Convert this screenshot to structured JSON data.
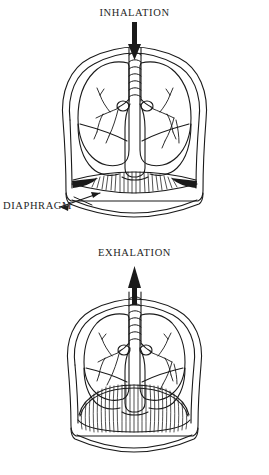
{
  "document": {
    "type": "anatomical-diagram",
    "subject": "Human lungs and diaphragm during breathing",
    "background_color": "#ffffff",
    "ink_color": "#1a1a1a"
  },
  "figures": [
    {
      "id": "inhalation",
      "caption": "INHALATION",
      "arrow_direction": "down",
      "arrow_meaning": "air flowing into trachea",
      "diaphragm_state": "flattened / contracted",
      "labels": [
        {
          "id": "diaphragm",
          "text": "DIAPHRAGM",
          "pointer": "leader-line-arrow"
        }
      ]
    },
    {
      "id": "exhalation",
      "caption": "EXHALATION",
      "arrow_direction": "up",
      "arrow_meaning": "air flowing out of trachea",
      "diaphragm_state": "domed / relaxed",
      "labels": []
    }
  ],
  "captions": {
    "inhalation": "INHALATION",
    "exhalation": "EXHALATION",
    "diaphragm": "DIAPHRAGM"
  }
}
